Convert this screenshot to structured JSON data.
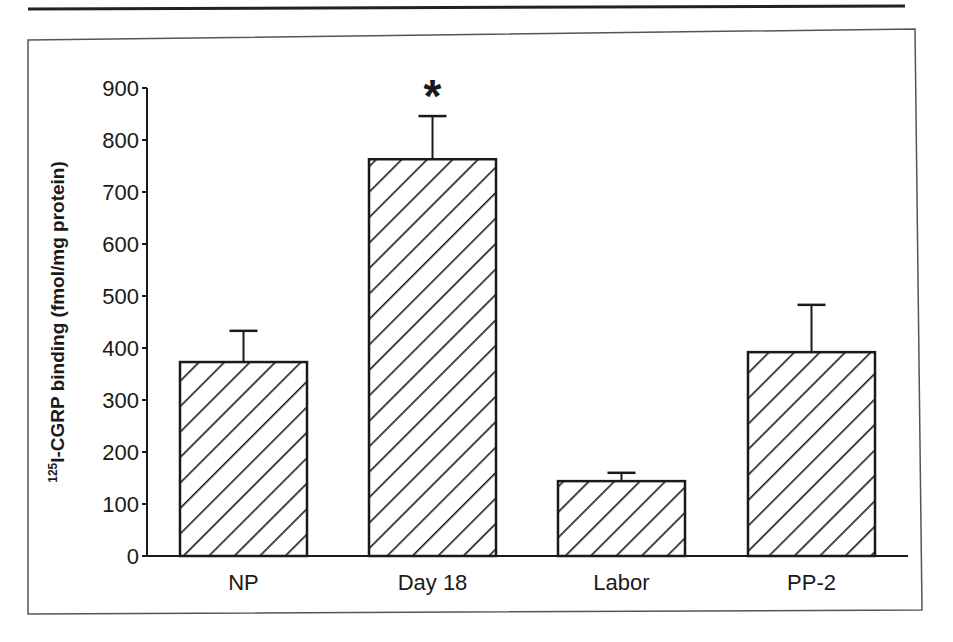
{
  "chart_data": {
    "type": "bar",
    "title": "",
    "xlabel": "",
    "ylabel": "125I-CGRP binding (fmol/mg protein)",
    "ylabel_parts": {
      "superscript": "125",
      "text": "I-CGRP binding (fmol/mg protein)"
    },
    "categories": [
      "NP",
      "Day 18",
      "Labor",
      "PP-2"
    ],
    "values": [
      373,
      763,
      144,
      392
    ],
    "error_upper": [
      433,
      846,
      160,
      483
    ],
    "errors": [
      60,
      83,
      16,
      91
    ],
    "annotations": [
      {
        "category": "Day 18",
        "text": "*",
        "meaning": "significant"
      }
    ],
    "ylim": [
      0,
      900
    ],
    "yticks": [
      0,
      100,
      200,
      300,
      400,
      500,
      600,
      700,
      800,
      900
    ],
    "grid": false,
    "legend": null,
    "bar_fill": "diagonal-hatch",
    "colors": {
      "ink": "#1a1a1a",
      "background": "#ffffff",
      "frame": "#555555"
    }
  }
}
